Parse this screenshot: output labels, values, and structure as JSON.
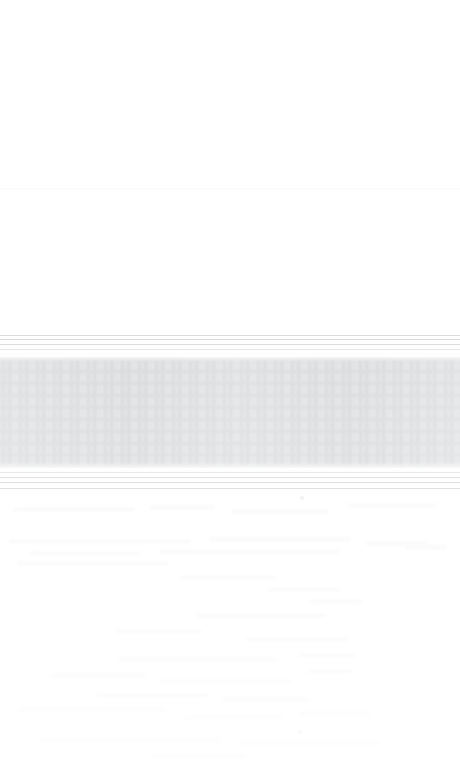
{
  "capture": {
    "kind": "washed-out-screenshot",
    "width": 460,
    "height": 768,
    "state_label": "",
    "note": ""
  },
  "colors": {
    "page_background": "#ffffff",
    "canvas": "#fefefe",
    "gray_block": "#c8cbcd",
    "rule_strong": "#c9ccce",
    "rule_soft": "#d8dbdd",
    "ghost_text": "#f1f2f3",
    "seam": "#f0f1f3"
  },
  "regions": {
    "blank_top": {
      "name": "blank-upper-area",
      "top": 0,
      "height": 335,
      "content": ""
    },
    "seam": {
      "name": "faint-horizontal-seam",
      "top": 188
    },
    "rule_band_top": {
      "name": "upper-rule-band",
      "top": 334,
      "rule_count": 4,
      "rule_offsets": [
        1,
        5,
        10,
        15
      ],
      "rule_styles": [
        "strong",
        "strong",
        "strong",
        "soft"
      ]
    },
    "gray_block": {
      "name": "central-gray-band",
      "top": 357,
      "height": 111,
      "label": "",
      "ghost_row_offsets": [
        4,
        16,
        28,
        40,
        52,
        64,
        76,
        88,
        99
      ]
    },
    "rule_band_bottom": {
      "name": "lower-rule-band",
      "top": 470,
      "rule_count": 4,
      "rule_offsets": [
        2,
        7,
        12,
        18
      ],
      "rule_styles": [
        "soft",
        "strong",
        "strong",
        "strong"
      ]
    },
    "blank_bottom": {
      "name": "blank-lower-area",
      "top": 492,
      "height": 276,
      "content": ""
    }
  },
  "ghost_traces": [
    {
      "left": 14,
      "top": 16,
      "width": 120,
      "height": 3
    },
    {
      "left": 150,
      "top": 14,
      "width": 64,
      "height": 3
    },
    {
      "left": 232,
      "top": 18,
      "width": 96,
      "height": 3
    },
    {
      "left": 348,
      "top": 12,
      "width": 88,
      "height": 3
    },
    {
      "left": 10,
      "top": 48,
      "width": 180,
      "height": 3
    },
    {
      "left": 210,
      "top": 46,
      "width": 140,
      "height": 3
    },
    {
      "left": 366,
      "top": 50,
      "width": 62,
      "height": 3
    },
    {
      "left": 30,
      "top": 60,
      "width": 110,
      "height": 3
    },
    {
      "left": 160,
      "top": 58,
      "width": 180,
      "height": 3
    },
    {
      "left": 406,
      "top": 54,
      "width": 40,
      "height": 3
    },
    {
      "left": 18,
      "top": 70,
      "width": 150,
      "height": 3
    },
    {
      "left": 180,
      "top": 84,
      "width": 96,
      "height": 3
    },
    {
      "left": 268,
      "top": 96,
      "width": 72,
      "height": 3
    },
    {
      "left": 310,
      "top": 108,
      "width": 52,
      "height": 3
    },
    {
      "left": 196,
      "top": 122,
      "width": 130,
      "height": 3
    },
    {
      "left": 116,
      "top": 138,
      "width": 86,
      "height": 3
    },
    {
      "left": 246,
      "top": 146,
      "width": 104,
      "height": 3
    },
    {
      "left": 118,
      "top": 166,
      "width": 160,
      "height": 3
    },
    {
      "left": 298,
      "top": 162,
      "width": 58,
      "height": 3
    },
    {
      "left": 50,
      "top": 182,
      "width": 96,
      "height": 3
    },
    {
      "left": 160,
      "top": 188,
      "width": 132,
      "height": 3
    },
    {
      "left": 308,
      "top": 178,
      "width": 44,
      "height": 3
    },
    {
      "left": 96,
      "top": 202,
      "width": 112,
      "height": 3
    },
    {
      "left": 222,
      "top": 206,
      "width": 86,
      "height": 3
    },
    {
      "left": 20,
      "top": 216,
      "width": 146,
      "height": 3
    },
    {
      "left": 186,
      "top": 224,
      "width": 96,
      "height": 3
    },
    {
      "left": 300,
      "top": 220,
      "width": 70,
      "height": 3
    },
    {
      "left": 40,
      "top": 246,
      "width": 180,
      "height": 3
    },
    {
      "left": 240,
      "top": 250,
      "width": 140,
      "height": 3
    },
    {
      "left": 150,
      "top": 262,
      "width": 96,
      "height": 3
    }
  ],
  "ghost_dots": [
    {
      "left": 298,
      "top": 238
    },
    {
      "left": 300,
      "top": 4
    }
  ]
}
